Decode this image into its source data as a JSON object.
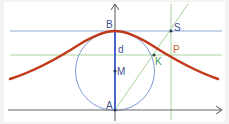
{
  "diagram": {
    "colors": {
      "background": "#ffffff",
      "frame": "#f3f3f3",
      "axis": "#555555",
      "blue_line": "#7d9fd6",
      "blue_axis": "#3f5fc8",
      "green_line": "#9fcf8f",
      "circle": "#6f8fcf",
      "curve": "#c0381a",
      "point": "#2f4f6f",
      "label_blue": "#3c4f8f",
      "label_orange": "#d0602a",
      "label_green": "#3f9f5f"
    },
    "labels": {
      "B": "B",
      "d": "d",
      "M": "M",
      "A": "A",
      "S": "S",
      "P": "P",
      "K": "K"
    },
    "elements": [
      {
        "name": "x-axis",
        "type": "arrow",
        "from": [
          8,
          110
        ],
        "to": [
          222,
          110
        ]
      },
      {
        "name": "y-axis",
        "type": "arrow",
        "from": [
          115,
          120
        ],
        "to": [
          115,
          4
        ]
      },
      {
        "name": "tangent-line-B",
        "type": "line",
        "y": 31
      },
      {
        "name": "horizontal-line-K",
        "type": "line",
        "y": 55
      },
      {
        "name": "vertical-line-S",
        "type": "line",
        "x": 171
      },
      {
        "name": "secant-A-S",
        "type": "line",
        "from": [
          115,
          110
        ],
        "to": [
          188,
          4
        ]
      },
      {
        "name": "circle",
        "type": "circle",
        "center": [
          115,
          71
        ],
        "r": 39
      },
      {
        "name": "diameter-d",
        "type": "segment",
        "from": [
          115,
          31
        ],
        "to": [
          115,
          110
        ]
      },
      {
        "name": "agnesi-curve",
        "type": "curve"
      }
    ],
    "points": {
      "A": [
        115,
        110
      ],
      "B": [
        115,
        31
      ],
      "M": [
        115,
        71
      ],
      "K": [
        154,
        55
      ],
      "S": [
        171,
        31
      ],
      "P": [
        171,
        55
      ]
    }
  }
}
